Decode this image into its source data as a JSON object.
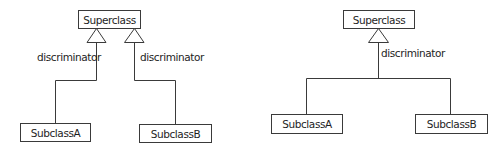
{
  "diagrams": [
    {
      "id": "left",
      "description": "Generalization with separate discriminator per subclass",
      "superclass": {
        "label": "Superclass"
      },
      "subclasses": [
        {
          "label": "SubclassA"
        },
        {
          "label": "SubclassB"
        }
      ],
      "discriminators": [
        {
          "label": "discriminator"
        },
        {
          "label": "discriminator"
        }
      ]
    },
    {
      "id": "right",
      "description": "Generalization with shared discriminator",
      "superclass": {
        "label": "Superclass"
      },
      "subclasses": [
        {
          "label": "SubclassA"
        },
        {
          "label": "SubclassB"
        }
      ],
      "discriminators": [
        {
          "label": "discriminator"
        }
      ]
    }
  ],
  "colors": {
    "line": "#3a3a3a",
    "text": "#1e1e1e",
    "background": "#ffffff"
  }
}
